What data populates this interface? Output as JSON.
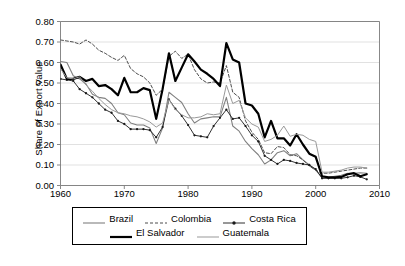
{
  "chart_data": {
    "type": "line",
    "title": "",
    "xlabel": "",
    "ylabel": "Share of Export Value",
    "xlim": [
      1960,
      2010
    ],
    "ylim": [
      0.0,
      0.8
    ],
    "xticks": [
      "1960",
      "1970",
      "1980",
      "1990",
      "2000",
      "2010"
    ],
    "xtick_values": [
      1960,
      1970,
      1980,
      1990,
      2000,
      2010
    ],
    "yticks": [
      "0.00",
      "0.10",
      "0.20",
      "0.30",
      "0.40",
      "0.50",
      "0.60",
      "0.70",
      "0.80"
    ],
    "ytick_values": [
      0.0,
      0.1,
      0.2,
      0.3,
      0.4,
      0.5,
      0.6,
      0.7,
      0.8
    ],
    "grid": "horizontal",
    "legend_position": "below",
    "x": [
      1960,
      1961,
      1962,
      1963,
      1964,
      1965,
      1966,
      1967,
      1968,
      1969,
      1970,
      1971,
      1972,
      1973,
      1974,
      1975,
      1976,
      1977,
      1978,
      1979,
      1980,
      1981,
      1982,
      1983,
      1984,
      1985,
      1986,
      1987,
      1988,
      1989,
      1990,
      1991,
      1992,
      1993,
      1994,
      1995,
      1996,
      1997,
      1998,
      1999,
      2000,
      2001,
      2002,
      2003,
      2004,
      2005,
      2006,
      2007,
      2008
    ],
    "series": [
      {
        "name": "Brazil",
        "style": "solid",
        "color": "#808080",
        "width": 1.1,
        "marker": "none",
        "values": [
          0.605,
          0.6,
          0.535,
          0.52,
          0.495,
          0.445,
          0.43,
          0.425,
          0.4,
          0.355,
          0.345,
          0.305,
          0.295,
          0.295,
          0.28,
          0.205,
          0.28,
          0.455,
          0.43,
          0.405,
          0.35,
          0.305,
          0.325,
          0.33,
          0.335,
          0.335,
          0.43,
          0.29,
          0.265,
          0.215,
          0.18,
          0.15,
          0.105,
          0.125,
          0.16,
          0.17,
          0.145,
          0.155,
          0.125,
          0.1,
          0.075,
          0.04,
          0.04,
          0.045,
          0.05,
          0.06,
          0.06,
          0.062,
          0.06
        ]
      },
      {
        "name": "Colombia",
        "style": "dashed",
        "color": "#4d4d4d",
        "width": 1.0,
        "marker": "none",
        "values": [
          0.71,
          0.705,
          0.7,
          0.69,
          0.71,
          0.69,
          0.66,
          0.645,
          0.625,
          0.61,
          0.635,
          0.57,
          0.545,
          0.53,
          0.5,
          0.44,
          0.47,
          0.63,
          0.655,
          0.62,
          0.64,
          0.565,
          0.52,
          0.5,
          0.505,
          0.5,
          0.585,
          0.455,
          0.43,
          0.315,
          0.26,
          0.225,
          0.16,
          0.155,
          0.19,
          0.185,
          0.15,
          0.145,
          0.125,
          0.095,
          0.075,
          0.06,
          0.06,
          0.065,
          0.07,
          0.075,
          0.08,
          0.085,
          0.085
        ]
      },
      {
        "name": "Costa Rica",
        "style": "solid",
        "color": "#1a1a1a",
        "width": 0.9,
        "marker": "dot",
        "values": [
          0.52,
          0.515,
          0.51,
          0.47,
          0.45,
          0.43,
          0.4,
          0.37,
          0.355,
          0.315,
          0.3,
          0.275,
          0.275,
          0.275,
          0.27,
          0.235,
          0.285,
          0.42,
          0.375,
          0.34,
          0.295,
          0.245,
          0.24,
          0.235,
          0.29,
          0.33,
          0.37,
          0.325,
          0.33,
          0.29,
          0.245,
          0.215,
          0.145,
          0.125,
          0.105,
          0.125,
          0.12,
          0.11,
          0.105,
          0.1,
          0.08,
          0.035,
          0.035,
          0.035,
          0.035,
          0.04,
          0.048,
          0.042,
          0.03
        ]
      },
      {
        "name": "El Salvador",
        "style": "solid",
        "color": "#000000",
        "width": 2.2,
        "marker": "none",
        "values": [
          0.59,
          0.52,
          0.52,
          0.53,
          0.51,
          0.52,
          0.485,
          0.49,
          0.47,
          0.44,
          0.525,
          0.455,
          0.455,
          0.475,
          0.465,
          0.325,
          0.47,
          0.645,
          0.51,
          0.575,
          0.64,
          0.605,
          0.565,
          0.545,
          0.52,
          0.485,
          0.695,
          0.615,
          0.6,
          0.4,
          0.39,
          0.35,
          0.235,
          0.315,
          0.23,
          0.23,
          0.195,
          0.25,
          0.2,
          0.155,
          0.14,
          0.045,
          0.04,
          0.04,
          0.042,
          0.055,
          0.06,
          0.045,
          0.055
        ]
      },
      {
        "name": "Guatemala",
        "style": "solid",
        "color": "#999999",
        "width": 1.0,
        "marker": "none",
        "values": [
          0.57,
          0.525,
          0.52,
          0.53,
          0.49,
          0.46,
          0.425,
          0.395,
          0.37,
          0.355,
          0.35,
          0.34,
          0.335,
          0.325,
          0.31,
          0.285,
          0.305,
          0.42,
          0.37,
          0.345,
          0.33,
          0.33,
          0.335,
          0.35,
          0.345,
          0.35,
          0.49,
          0.4,
          0.415,
          0.33,
          0.3,
          0.285,
          0.215,
          0.225,
          0.245,
          0.29,
          0.24,
          0.25,
          0.245,
          0.225,
          0.215,
          0.065,
          0.065,
          0.07,
          0.075,
          0.085,
          0.09,
          0.09,
          0.085
        ]
      }
    ]
  },
  "legend": {
    "rows": [
      [
        {
          "name": "Brazil",
          "swatch": "legend-line-solid-gray"
        },
        {
          "name": "Colombia",
          "swatch": "legend-line-dashed"
        },
        {
          "name": "Costa Rica",
          "swatch": "legend-line-marker"
        }
      ],
      [
        {
          "name": "El Salvador",
          "swatch": "legend-line-thick-black"
        },
        {
          "name": "Guatemala",
          "swatch": "legend-line-solid-lightgray"
        }
      ]
    ]
  }
}
